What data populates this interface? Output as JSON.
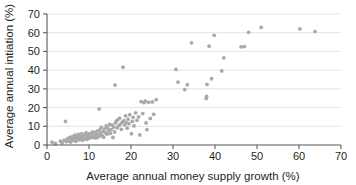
{
  "chart_data": {
    "type": "scatter",
    "title": "",
    "xlabel": "Average annual money supply growth (%)",
    "ylabel": "Average annual intiation (%)",
    "xlim": [
      0,
      70
    ],
    "ylim": [
      0,
      70
    ],
    "xticks": [
      0,
      10,
      20,
      30,
      40,
      50,
      60,
      70
    ],
    "yticks": [
      0,
      10,
      20,
      30,
      40,
      50,
      60,
      70
    ],
    "grid": "horizontal",
    "legend": "none",
    "marker_color": "#a7a9ac",
    "axis_color": "#58595b",
    "gridline_color": "#d9dcdd",
    "text_color": "#231f20",
    "series": [
      {
        "name": "Countries",
        "points": [
          [
            1.2,
            1.5
          ],
          [
            2.0,
            0.8
          ],
          [
            3.2,
            2.0
          ],
          [
            3.6,
            1.2
          ],
          [
            4.1,
            2.6
          ],
          [
            4.4,
            12.6
          ],
          [
            4.6,
            1.8
          ],
          [
            4.9,
            3.4
          ],
          [
            5.2,
            2.2
          ],
          [
            5.4,
            4.0
          ],
          [
            5.6,
            1.6
          ],
          [
            5.9,
            3.0
          ],
          [
            6.1,
            4.6
          ],
          [
            6.3,
            2.4
          ],
          [
            6.5,
            3.6
          ],
          [
            6.7,
            5.2
          ],
          [
            6.9,
            2.0
          ],
          [
            7.1,
            4.2
          ],
          [
            7.3,
            3.2
          ],
          [
            7.5,
            5.6
          ],
          [
            7.7,
            2.8
          ],
          [
            7.9,
            4.4
          ],
          [
            8.1,
            3.8
          ],
          [
            8.3,
            6.0
          ],
          [
            8.5,
            2.6
          ],
          [
            8.7,
            4.8
          ],
          [
            8.9,
            3.4
          ],
          [
            9.1,
            5.4
          ],
          [
            9.3,
            6.6
          ],
          [
            9.5,
            3.0
          ],
          [
            9.7,
            4.6
          ],
          [
            9.9,
            5.8
          ],
          [
            10.1,
            3.6
          ],
          [
            10.3,
            6.2
          ],
          [
            10.5,
            4.2
          ],
          [
            10.7,
            5.0
          ],
          [
            10.9,
            7.0
          ],
          [
            11.1,
            4.0
          ],
          [
            11.3,
            6.4
          ],
          [
            11.5,
            5.2
          ],
          [
            11.7,
            3.8
          ],
          [
            11.9,
            7.4
          ],
          [
            12.1,
            5.6
          ],
          [
            12.3,
            4.4
          ],
          [
            12.5,
            8.0
          ],
          [
            12.4,
            19.2
          ],
          [
            12.7,
            6.0
          ],
          [
            12.9,
            9.4
          ],
          [
            13.1,
            5.0
          ],
          [
            13.3,
            7.2
          ],
          [
            13.5,
            4.2
          ],
          [
            13.7,
            8.6
          ],
          [
            13.9,
            6.6
          ],
          [
            14.1,
            10.2
          ],
          [
            14.3,
            5.8
          ],
          [
            14.5,
            9.0
          ],
          [
            14.7,
            7.6
          ],
          [
            14.9,
            11.0
          ],
          [
            15.1,
            6.2
          ],
          [
            15.3,
            8.2
          ],
          [
            15.5,
            10.6
          ],
          [
            15.7,
            4.0
          ],
          [
            15.9,
            9.6
          ],
          [
            16.1,
            7.0
          ],
          [
            16.3,
            11.8
          ],
          [
            16.2,
            32.0
          ],
          [
            16.5,
            12.8
          ],
          [
            16.7,
            9.2
          ],
          [
            16.9,
            13.6
          ],
          [
            17.1,
            10.4
          ],
          [
            17.3,
            14.4
          ],
          [
            17.5,
            11.2
          ],
          [
            17.7,
            8.4
          ],
          [
            17.9,
            12.2
          ],
          [
            18.1,
            41.6
          ],
          [
            18.3,
            13.0
          ],
          [
            18.5,
            10.8
          ],
          [
            18.7,
            15.6
          ],
          [
            18.9,
            12.0
          ],
          [
            19.1,
            9.0
          ],
          [
            19.3,
            13.8
          ],
          [
            19.5,
            11.4
          ],
          [
            19.7,
            16.2
          ],
          [
            20.1,
            6.0
          ],
          [
            20.3,
            12.6
          ],
          [
            20.5,
            14.8
          ],
          [
            20.7,
            10.2
          ],
          [
            21.1,
            17.2
          ],
          [
            21.4,
            13.2
          ],
          [
            21.8,
            15.0
          ],
          [
            22.1,
            5.4
          ],
          [
            22.4,
            23.2
          ],
          [
            22.8,
            16.8
          ],
          [
            23.1,
            22.6
          ],
          [
            23.4,
            23.4
          ],
          [
            23.6,
            11.8
          ],
          [
            23.8,
            8.2
          ],
          [
            24.2,
            22.8
          ],
          [
            24.6,
            14.2
          ],
          [
            25.1,
            23.0
          ],
          [
            25.4,
            16.4
          ],
          [
            26.0,
            24.2
          ],
          [
            30.7,
            40.4
          ],
          [
            31.2,
            33.6
          ],
          [
            32.8,
            29.6
          ],
          [
            33.4,
            32.2
          ],
          [
            34.4,
            54.6
          ],
          [
            37.9,
            24.8
          ],
          [
            38.0,
            26.0
          ],
          [
            38.1,
            32.4
          ],
          [
            38.6,
            52.8
          ],
          [
            39.2,
            35.4
          ],
          [
            39.8,
            58.6
          ],
          [
            41.6,
            39.6
          ],
          [
            42.1,
            46.6
          ],
          [
            46.2,
            52.4
          ],
          [
            47.0,
            52.6
          ],
          [
            48.0,
            60.2
          ],
          [
            51.0,
            62.8
          ],
          [
            60.2,
            62.0
          ],
          [
            63.8,
            60.6
          ]
        ]
      }
    ]
  }
}
